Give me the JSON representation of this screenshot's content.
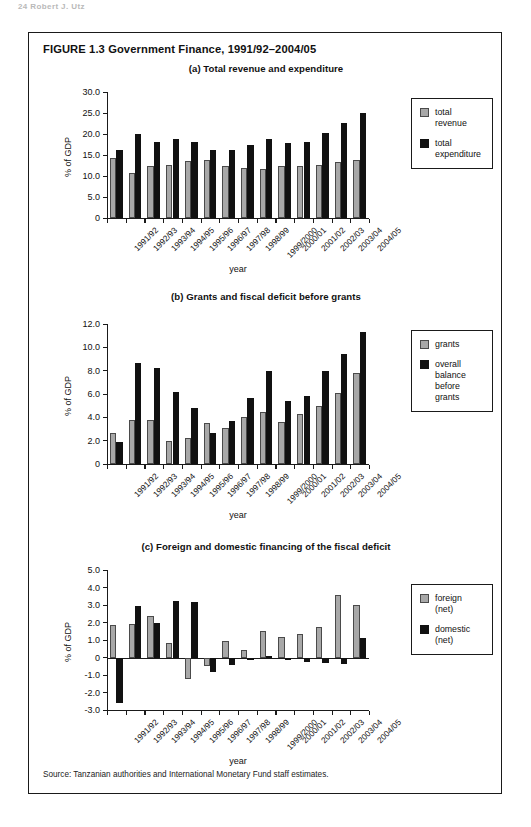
{
  "running_head": "24   Robert J. Utz",
  "figure": {
    "title": "FIGURE 1.3  Government Finance, 1991/92–2004/05",
    "source": "Source: Tanzanian authorities and International Monetary Fund staff estimates."
  },
  "chart_data": [
    {
      "type": "bar",
      "title": "(a) Total revenue and expenditure",
      "xlabel": "year",
      "ylabel": "% of GDP",
      "ylim": [
        0,
        30
      ],
      "yticks": [
        "0",
        "5.0",
        "10.0",
        "15.0",
        "20.0",
        "25.0",
        "30.0"
      ],
      "ytick_values": [
        0,
        5,
        10,
        15,
        20,
        25,
        30
      ],
      "grid": false,
      "legend_position": "right",
      "categories": [
        "1991/92",
        "1992/93",
        "1993/94",
        "1994/95",
        "1995/96",
        "1996/97",
        "1997/98",
        "1998/99",
        "1999/2000",
        "2000/01",
        "2001/02",
        "2002/03",
        "2003/04",
        "2004/05"
      ],
      "series": [
        {
          "name": "total revenue",
          "color": "#a8a8a8",
          "values": [
            14.4,
            10.8,
            12.3,
            12.7,
            13.6,
            13.9,
            12.4,
            11.8,
            11.6,
            12.3,
            12.5,
            12.6,
            13.3,
            13.8
          ]
        },
        {
          "name": "total expenditure",
          "color": "#111111",
          "values": [
            16.1,
            20.0,
            18.2,
            18.7,
            18.0,
            16.2,
            16.1,
            17.3,
            18.9,
            17.9,
            18.1,
            20.2,
            22.7,
            25.1
          ]
        }
      ]
    },
    {
      "type": "bar",
      "title": "(b) Grants and fiscal deficit before grants",
      "xlabel": "year",
      "ylabel": "% of GDP",
      "ylim": [
        0,
        12
      ],
      "yticks": [
        "0",
        "2.0",
        "4.0",
        "6.0",
        "8.0",
        "10.0",
        "12.0"
      ],
      "ytick_values": [
        0,
        2,
        4,
        6,
        8,
        10,
        12
      ],
      "grid": false,
      "legend_position": "right",
      "categories": [
        "1991/92",
        "1992/93",
        "1993/94",
        "1994/95",
        "1995/96",
        "1996/97",
        "1997/98",
        "1998/99",
        "1999/2000",
        "2000/01",
        "2001/02",
        "2002/03",
        "2003/04",
        "2004/05"
      ],
      "series": [
        {
          "name": "grants",
          "color": "#a8a8a8",
          "values": [
            2.65,
            3.75,
            3.75,
            2.0,
            2.2,
            3.55,
            3.05,
            4.0,
            4.5,
            3.6,
            4.3,
            5.0,
            6.1,
            7.8
          ]
        },
        {
          "name": "overall balance before grants",
          "color": "#111111",
          "values": [
            1.85,
            8.7,
            8.25,
            6.2,
            4.8,
            2.65,
            3.7,
            5.65,
            7.95,
            5.4,
            5.8,
            7.95,
            9.4,
            11.3
          ]
        }
      ]
    },
    {
      "type": "bar",
      "title": "(c) Foreign and domestic financing of the fiscal deficit",
      "xlabel": "year",
      "ylabel": "% of GDP",
      "ylim": [
        -3,
        5
      ],
      "yticks": [
        "-3.0",
        "-2.0",
        "-1.0",
        "0",
        "1.0",
        "2.0",
        "3.0",
        "4.0",
        "5.0"
      ],
      "ytick_values": [
        -3,
        -2,
        -1,
        0,
        1,
        2,
        3,
        4,
        5
      ],
      "grid": false,
      "legend_position": "right",
      "categories": [
        "1991/92",
        "1992/93",
        "1993/94",
        "1994/95",
        "1995/96",
        "1996/97",
        "1997/98",
        "1998/99",
        "1999/2000",
        "2000/01",
        "2001/02",
        "2002/03",
        "2003/04",
        "2004/05"
      ],
      "series": [
        {
          "name": "foreign (net)",
          "color": "#a8a8a8",
          "values": [
            1.85,
            1.9,
            2.4,
            0.85,
            -1.2,
            -0.5,
            0.95,
            0.45,
            1.5,
            1.2,
            1.35,
            1.75,
            3.55,
            3.0
          ]
        },
        {
          "name": "domestic (net)",
          "color": "#111111",
          "values": [
            -2.6,
            2.95,
            2.0,
            3.25,
            3.2,
            -0.8,
            -0.45,
            -0.15,
            0.1,
            -0.05,
            -0.25,
            -0.3,
            -0.35,
            1.1
          ]
        }
      ]
    }
  ]
}
